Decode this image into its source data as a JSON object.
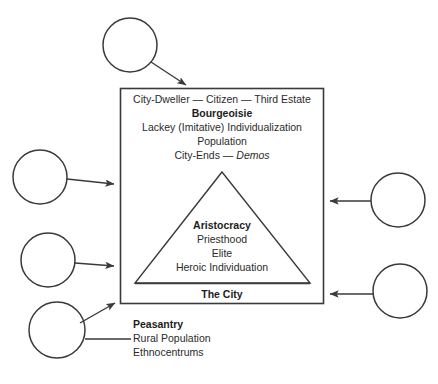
{
  "diagram": {
    "title_absent": true,
    "colors": {
      "stroke": "#3a3a3a",
      "text": "#2b2b2b",
      "bold_text": "#1d1d1d",
      "background": "#ffffff"
    },
    "city_box": {
      "label": "The City",
      "upper_lines": [
        {
          "text": "City-Dweller — Citizen — Third Estate",
          "style": "regular"
        },
        {
          "text": "Bourgeoisie",
          "style": "bold"
        },
        {
          "text": "Lackey (Imitative) Individualization",
          "style": "regular"
        },
        {
          "text": "Population",
          "style": "regular"
        }
      ],
      "city_ends_prefix": "City-Ends — ",
      "city_ends_italic": "Demos"
    },
    "triangle": {
      "lines": [
        {
          "text": "Aristocracy",
          "style": "bold"
        },
        {
          "text": "Priesthood",
          "style": "regular"
        },
        {
          "text": "Elite",
          "style": "regular"
        },
        {
          "text": "Heroic Individuation",
          "style": "regular"
        }
      ]
    },
    "peasantry": {
      "heading": "Peasantry",
      "lines": [
        "Rural Population",
        "Ethnocentrums"
      ]
    },
    "nodes": [
      {
        "name": "circle-top",
        "label": "",
        "cx": 130,
        "cy": 45,
        "r": 27
      },
      {
        "name": "circle-left-upper",
        "label": "",
        "cx": 40,
        "cy": 177,
        "r": 27
      },
      {
        "name": "circle-left-lower",
        "label": "",
        "cx": 48,
        "cy": 260,
        "r": 27
      },
      {
        "name": "circle-bottom-left",
        "label": "",
        "cx": 57,
        "cy": 330,
        "r": 28
      },
      {
        "name": "circle-right-upper",
        "label": "",
        "cx": 398,
        "cy": 200,
        "r": 27
      },
      {
        "name": "circle-right-lower",
        "label": "",
        "cx": 400,
        "cy": 291,
        "r": 27
      }
    ],
    "connectors": [
      {
        "name": "connector-top-to-box",
        "arrow": true
      },
      {
        "name": "connector-left-upper-to-box",
        "arrow": true
      },
      {
        "name": "connector-left-lower-to-box",
        "arrow": true
      },
      {
        "name": "connector-bottom-left-to-box",
        "arrow": true
      },
      {
        "name": "connector-bottom-left-to-peasantry",
        "arrow": false
      },
      {
        "name": "connector-right-upper-to-box",
        "arrow": true
      },
      {
        "name": "connector-right-lower-to-box",
        "arrow": true
      }
    ]
  }
}
